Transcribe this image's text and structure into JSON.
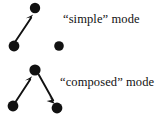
{
  "figure": {
    "background_color": "#ffffff",
    "ink_color": "#111111",
    "width": 158,
    "height": 122,
    "panels": [
      {
        "id": "simple",
        "label": "“simple” mode",
        "label_position": {
          "x": 63,
          "y": 13
        },
        "nodes": [
          {
            "id": "s-top",
            "cx": 35,
            "cy": 8,
            "r": 5.2
          },
          {
            "id": "s-left",
            "cx": 14,
            "cy": 46,
            "r": 5.4
          },
          {
            "id": "s-right",
            "cx": 59,
            "cy": 46,
            "r": 4.8
          }
        ],
        "edges": [
          {
            "from": "s-left",
            "to": "s-top",
            "x1": 15,
            "y1": 42,
            "x2": 31,
            "y2": 17,
            "arrow": "end"
          }
        ]
      },
      {
        "id": "composed",
        "label": "“composed” mode",
        "label_position": {
          "x": 60,
          "y": 76
        },
        "nodes": [
          {
            "id": "c-top",
            "cx": 35,
            "cy": 70,
            "r": 5.6
          },
          {
            "id": "c-left",
            "cx": 13,
            "cy": 106,
            "r": 5.4
          },
          {
            "id": "c-right",
            "cx": 57,
            "cy": 108,
            "r": 5.4
          }
        ],
        "edges": [
          {
            "from": "c-left",
            "to": "c-top",
            "x1": 15,
            "y1": 102,
            "x2": 30,
            "y2": 78,
            "arrow": "end"
          },
          {
            "from": "c-top",
            "to": "c-right",
            "x1": 39,
            "y1": 75,
            "x2": 54,
            "y2": 102,
            "arrow": "end"
          }
        ]
      }
    ]
  }
}
